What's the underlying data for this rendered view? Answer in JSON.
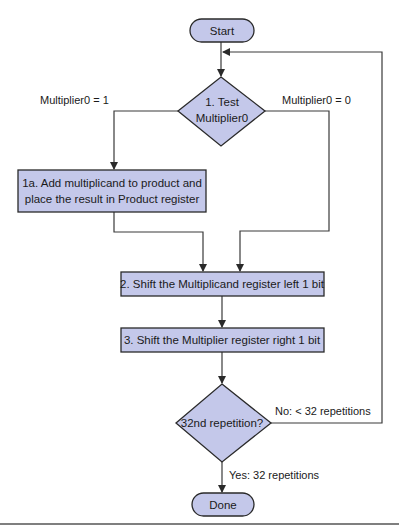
{
  "diagram": {
    "type": "flowchart",
    "colors": {
      "node_fill": "#c4c8ea",
      "node_stroke": "#2a2a2a",
      "line": "#3a3a3a",
      "background": "#ffffff"
    },
    "nodes": {
      "start": {
        "label": "Start",
        "shape": "terminal"
      },
      "test": {
        "label_line1": "1.  Test",
        "label_line2": "Multiplier0",
        "shape": "decision"
      },
      "add": {
        "label_line1": "1a.  Add multiplicand to product and",
        "label_line2": "place the result in Product register",
        "shape": "process"
      },
      "shift_left": {
        "label": "2.  Shift the Multiplicand register left 1 bit",
        "shape": "process"
      },
      "shift_right": {
        "label": "3.  Shift the Multiplier register right 1 bit",
        "shape": "process"
      },
      "repeat": {
        "label": "32nd repetition?",
        "shape": "decision"
      },
      "done": {
        "label": "Done",
        "shape": "terminal"
      }
    },
    "edges": {
      "test_true": {
        "label": "Multiplier0 = 1",
        "from": "test",
        "to": "add"
      },
      "test_false": {
        "label": "Multiplier0 = 0",
        "from": "test",
        "to": "shift_left"
      },
      "add_to_shift": {
        "from": "add",
        "to": "shift_left"
      },
      "shift_left_to_right": {
        "from": "shift_left",
        "to": "shift_right"
      },
      "shift_to_repeat": {
        "from": "shift_right",
        "to": "repeat"
      },
      "repeat_no": {
        "label": "No:  < 32 repetitions",
        "from": "repeat",
        "to": "test"
      },
      "repeat_yes": {
        "label": "Yes:  32 repetitions",
        "from": "repeat",
        "to": "done"
      },
      "start_to_test": {
        "from": "start",
        "to": "test"
      }
    }
  }
}
